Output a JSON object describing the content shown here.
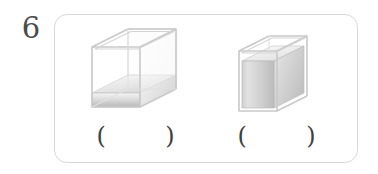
{
  "question": {
    "number": "6",
    "card": {
      "border_color": "#d9d9d9",
      "background": "#ffffff"
    }
  },
  "items": [
    {
      "id": "tank-left",
      "figure_name": "open-rectangular-tank-lying-low-water",
      "description": "Transparent open-top rectangular glass tank shown in oblique projection, resting on its long side, with a shallow layer of water at the bottom",
      "orientation": "lying-horizontal",
      "fill_label": "low water level",
      "answer": {
        "left_paren": "(",
        "value": "",
        "right_paren": ")"
      }
    },
    {
      "id": "tank-right",
      "figure_name": "open-rectangular-tank-upright-high-water",
      "description": "Transparent open-top rectangular glass tank shown in oblique projection, standing upright on its short side, nearly full of water",
      "orientation": "upright-vertical",
      "fill_label": "high water level",
      "answer": {
        "left_paren": "(",
        "value": "",
        "right_paren": ")"
      }
    }
  ],
  "colors": {
    "number_text": "#4b4b4b",
    "card_border": "#d9d9d9",
    "glass_edge": "#c9c9c9",
    "glass_edge_light": "#dedede",
    "water_top": "#f2f2f2",
    "water_bottom": "#bdbdbd",
    "water_side": "#cfcfcf",
    "paren_text": "#3f3f3f",
    "page_background": "#ffffff"
  }
}
